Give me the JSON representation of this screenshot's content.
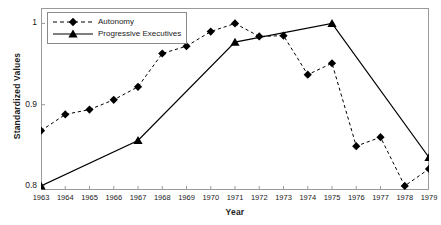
{
  "chart_data": {
    "type": "line",
    "title": "",
    "xlabel": "Year",
    "ylabel": "Standardized Values",
    "xlim": [
      1963,
      1979
    ],
    "ylim": [
      0.795,
      1.019
    ],
    "grid": false,
    "legend_position": "top-left",
    "ytick_labels": [
      "1",
      "0.9",
      "0.8"
    ],
    "ytick_values": [
      1,
      0.9,
      0.8
    ],
    "categories": [
      1963,
      1964,
      1965,
      1966,
      1967,
      1968,
      1969,
      1970,
      1971,
      1972,
      1973,
      1974,
      1975,
      1976,
      1977,
      1978,
      1979
    ],
    "xtick_labels": [
      "1963",
      "1964",
      "1965",
      "1966",
      "1967",
      "1968",
      "1969",
      "1970",
      "1971",
      "1972",
      "1973",
      "1974",
      "1975",
      "1976",
      "1977",
      "1978",
      "1979"
    ],
    "series": [
      {
        "name": "Autonomy",
        "line_style": "dashed",
        "marker": "diamond",
        "color": "#000000",
        "x": [
          1963,
          1964,
          1965,
          1966,
          1967,
          1968,
          1969,
          1970,
          1971,
          1972,
          1973,
          1974,
          1975,
          1976,
          1977,
          1978,
          1979
        ],
        "values": [
          0.868,
          0.888,
          0.894,
          0.906,
          0.922,
          0.963,
          0.972,
          0.99,
          1.0,
          0.984,
          0.985,
          0.937,
          0.951,
          0.849,
          0.86,
          0.8,
          0.821
        ]
      },
      {
        "name": "Progressive Executives",
        "line_style": "solid",
        "marker": "triangle",
        "color": "#000000",
        "x": [
          1963,
          1967,
          1971,
          1975,
          1979
        ],
        "values": [
          0.8,
          0.856,
          0.977,
          1.0,
          0.835
        ]
      }
    ]
  },
  "legend": {
    "items": [
      {
        "label": "Autonomy"
      },
      {
        "label": "Progressive Executives"
      }
    ]
  },
  "axes": {
    "frame_color": "#9a9a9a",
    "text_color": "#1a1a1a"
  }
}
